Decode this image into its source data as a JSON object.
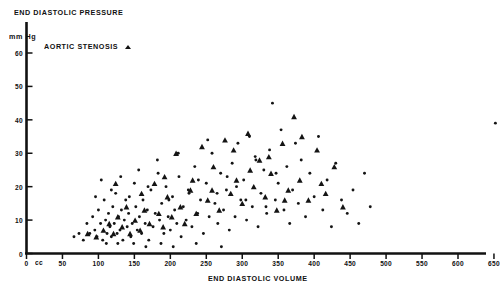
{
  "title": "END DIASTOLIC PRESSURE",
  "y_unit_label": "mm Hg",
  "x_unit_label": "cc",
  "xlabel": "END DIASTOLIC VOLUME",
  "legend": {
    "label": "AORTIC STENOSIS",
    "marker": "triangle-up"
  },
  "axes": {
    "x_ticks": [
      "0",
      "50",
      "100",
      "150",
      "200",
      "250",
      "300",
      "350",
      "400",
      "450",
      "500",
      "550",
      "600",
      "650"
    ],
    "y_ticks": [
      "0",
      "10",
      "20",
      "30",
      "40",
      "50",
      "60"
    ]
  },
  "colors": {
    "ink": "#111111",
    "background": "#ffffff"
  },
  "chart_data": {
    "type": "scatter",
    "title": "END DIASTOLIC PRESSURE",
    "xlabel": "END DIASTOLIC VOLUME",
    "ylabel": "mm Hg",
    "x_unit": "cc",
    "y_unit": "mm Hg",
    "xlim": [
      0,
      670
    ],
    "ylim": [
      0,
      63
    ],
    "x_ticks": [
      0,
      50,
      100,
      150,
      200,
      250,
      300,
      350,
      400,
      450,
      500,
      550,
      600,
      650
    ],
    "y_ticks": [
      0,
      10,
      20,
      30,
      40,
      50,
      60
    ],
    "grid": false,
    "legend_position": "top-left",
    "series": [
      {
        "name": "other",
        "marker": "circle",
        "points": [
          [
            66,
            5
          ],
          [
            73,
            6
          ],
          [
            79,
            4
          ],
          [
            84,
            9
          ],
          [
            88,
            6
          ],
          [
            92,
            11
          ],
          [
            95,
            7
          ],
          [
            98,
            5
          ],
          [
            100,
            13
          ],
          [
            103,
            9
          ],
          [
            106,
            4
          ],
          [
            108,
            16
          ],
          [
            110,
            10
          ],
          [
            112,
            6
          ],
          [
            114,
            12
          ],
          [
            116,
            8
          ],
          [
            118,
            5
          ],
          [
            120,
            14
          ],
          [
            122,
            9
          ],
          [
            124,
            18
          ],
          [
            126,
            6
          ],
          [
            128,
            11
          ],
          [
            130,
            7
          ],
          [
            132,
            13
          ],
          [
            134,
            4
          ],
          [
            136,
            10
          ],
          [
            138,
            16
          ],
          [
            140,
            8
          ],
          [
            142,
            12
          ],
          [
            145,
            5
          ],
          [
            147,
            9
          ],
          [
            150,
            21
          ],
          [
            152,
            14
          ],
          [
            154,
            7
          ],
          [
            157,
            11
          ],
          [
            160,
            6
          ],
          [
            162,
            16
          ],
          [
            165,
            9
          ],
          [
            168,
            13
          ],
          [
            170,
            4
          ],
          [
            173,
            19
          ],
          [
            176,
            8
          ],
          [
            179,
            12
          ],
          [
            182,
            28
          ],
          [
            185,
            10
          ],
          [
            188,
            15
          ],
          [
            191,
            6
          ],
          [
            194,
            20
          ],
          [
            197,
            11
          ],
          [
            200,
            7
          ],
          [
            203,
            17
          ],
          [
            206,
            13
          ],
          [
            209,
            9
          ],
          [
            212,
            23
          ],
          [
            215,
            5
          ],
          [
            218,
            14
          ],
          [
            222,
            10
          ],
          [
            226,
            18
          ],
          [
            230,
            8
          ],
          [
            234,
            26
          ],
          [
            238,
            12
          ],
          [
            242,
            16
          ],
          [
            246,
            6
          ],
          [
            250,
            21
          ],
          [
            254,
            11
          ],
          [
            258,
            30
          ],
          [
            262,
            15
          ],
          [
            266,
            9
          ],
          [
            270,
            24
          ],
          [
            274,
            13
          ],
          [
            278,
            19
          ],
          [
            282,
            7
          ],
          [
            286,
            27
          ],
          [
            290,
            11
          ],
          [
            294,
            33
          ],
          [
            298,
            16
          ],
          [
            302,
            22
          ],
          [
            306,
            10
          ],
          [
            310,
            35
          ],
          [
            314,
            14
          ],
          [
            318,
            29
          ],
          [
            322,
            8
          ],
          [
            326,
            18
          ],
          [
            330,
            25
          ],
          [
            334,
            12
          ],
          [
            338,
            31
          ],
          [
            342,
            45
          ],
          [
            346,
            16
          ],
          [
            350,
            21
          ],
          [
            354,
            37
          ],
          [
            358,
            13
          ],
          [
            362,
            26
          ],
          [
            366,
            9
          ],
          [
            370,
            19
          ],
          [
            374,
            33
          ],
          [
            378,
            15
          ],
          [
            382,
            28
          ],
          [
            388,
            11
          ],
          [
            394,
            24
          ],
          [
            400,
            17
          ],
          [
            406,
            35
          ],
          [
            412,
            13
          ],
          [
            418,
            22
          ],
          [
            424,
            8
          ],
          [
            430,
            27
          ],
          [
            438,
            16
          ],
          [
            446,
            12
          ],
          [
            454,
            19
          ],
          [
            462,
            9
          ],
          [
            470,
            24
          ],
          [
            478,
            14
          ],
          [
            652,
            39
          ],
          [
            96,
            17
          ],
          [
            104,
            22
          ],
          [
            118,
            19
          ],
          [
            131,
            23
          ],
          [
            143,
            17
          ],
          [
            156,
            25
          ],
          [
            169,
            20
          ],
          [
            183,
            24
          ],
          [
            198,
            16
          ],
          [
            211,
            30
          ],
          [
            225,
            19
          ],
          [
            239,
            22
          ],
          [
            252,
            34
          ],
          [
            265,
            18
          ],
          [
            279,
            23
          ],
          [
            292,
            20
          ],
          [
            305,
            16
          ],
          [
            319,
            28
          ],
          [
            333,
            14
          ],
          [
            347,
            24
          ],
          [
            111,
            3
          ],
          [
            127,
            3
          ],
          [
            149,
            3
          ],
          [
            166,
            2
          ],
          [
            187,
            3
          ],
          [
            204,
            2
          ],
          [
            236,
            3
          ],
          [
            271,
            2
          ]
        ]
      },
      {
        "name": "AORTIC STENOSIS",
        "marker": "triangle",
        "points": [
          [
            85,
            6
          ],
          [
            97,
            5
          ],
          [
            107,
            7
          ],
          [
            115,
            9
          ],
          [
            121,
            6
          ],
          [
            127,
            11
          ],
          [
            133,
            8
          ],
          [
            139,
            14
          ],
          [
            144,
            6
          ],
          [
            151,
            10
          ],
          [
            158,
            7
          ],
          [
            164,
            13
          ],
          [
            171,
            9
          ],
          [
            178,
            21
          ],
          [
            184,
            12
          ],
          [
            190,
            8
          ],
          [
            196,
            17
          ],
          [
            202,
            11
          ],
          [
            208,
            30
          ],
          [
            214,
            14
          ],
          [
            220,
            9
          ],
          [
            228,
            19
          ],
          [
            236,
            12
          ],
          [
            244,
            32
          ],
          [
            252,
            16
          ],
          [
            260,
            26
          ],
          [
            268,
            13
          ],
          [
            276,
            34
          ],
          [
            284,
            18
          ],
          [
            292,
            22
          ],
          [
            300,
            15
          ],
          [
            308,
            36
          ],
          [
            316,
            20
          ],
          [
            324,
            28
          ],
          [
            332,
            17
          ],
          [
            340,
            24
          ],
          [
            348,
            13
          ],
          [
            356,
            33
          ],
          [
            364,
            19
          ],
          [
            372,
            41
          ],
          [
            380,
            22
          ],
          [
            392,
            16
          ],
          [
            404,
            31
          ],
          [
            416,
            18
          ],
          [
            428,
            26
          ],
          [
            440,
            14
          ],
          [
            124,
            21
          ],
          [
            160,
            18
          ],
          [
            192,
            23
          ],
          [
            231,
            22
          ],
          [
            258,
            19
          ],
          [
            288,
            31
          ],
          [
            311,
            25
          ],
          [
            337,
            29
          ],
          [
            359,
            16
          ],
          [
            383,
            35
          ],
          [
            410,
            21
          ]
        ]
      }
    ]
  }
}
